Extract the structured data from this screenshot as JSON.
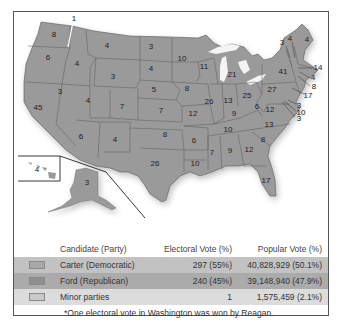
{
  "map": {
    "title": "1976 Presidential Election Electoral Map",
    "fill_color": "#9a9a9a",
    "state_labels": [
      {
        "state": "WA",
        "votes": "8",
        "x": 54,
        "y": 35
      },
      {
        "state": "WA-Reagan",
        "votes": "1",
        "x": 74,
        "y": 19
      },
      {
        "state": "OR",
        "votes": "6",
        "x": 48,
        "y": 58
      },
      {
        "state": "ID",
        "votes": "4",
        "x": 77,
        "y": 64
      },
      {
        "state": "MT",
        "votes": "4",
        "x": 107,
        "y": 46
      },
      {
        "state": "ND",
        "votes": "3",
        "x": 151,
        "y": 47
      },
      {
        "state": "SD",
        "votes": "4",
        "x": 151,
        "y": 69
      },
      {
        "state": "WY",
        "votes": "3",
        "x": 113,
        "y": 77
      },
      {
        "state": "CA",
        "votes": "45",
        "x": 38,
        "y": 108
      },
      {
        "state": "NV",
        "votes": "3",
        "x": 60,
        "y": 92
      },
      {
        "state": "UT",
        "votes": "4",
        "x": 88,
        "y": 101
      },
      {
        "state": "CO",
        "votes": "7",
        "x": 122,
        "y": 107
      },
      {
        "state": "NE",
        "votes": "5",
        "x": 154,
        "y": 90
      },
      {
        "state": "KS",
        "votes": "7",
        "x": 161,
        "y": 111
      },
      {
        "state": "AZ",
        "votes": "6",
        "x": 81,
        "y": 137
      },
      {
        "state": "NM",
        "votes": "4",
        "x": 115,
        "y": 140
      },
      {
        "state": "OK",
        "votes": "8",
        "x": 165,
        "y": 135
      },
      {
        "state": "TX",
        "votes": "26",
        "x": 155,
        "y": 164
      },
      {
        "state": "MN",
        "votes": "10",
        "x": 182,
        "y": 59
      },
      {
        "state": "IA",
        "votes": "8",
        "x": 187,
        "y": 89
      },
      {
        "state": "MO",
        "votes": "12",
        "x": 193,
        "y": 114
      },
      {
        "state": "AR",
        "votes": "6",
        "x": 194,
        "y": 141
      },
      {
        "state": "LA",
        "votes": "10",
        "x": 195,
        "y": 164
      },
      {
        "state": "WI",
        "votes": "11",
        "x": 204,
        "y": 67
      },
      {
        "state": "IL",
        "votes": "26",
        "x": 209,
        "y": 102
      },
      {
        "state": "MI",
        "votes": "21",
        "x": 232,
        "y": 75
      },
      {
        "state": "IN",
        "votes": "13",
        "x": 228,
        "y": 101
      },
      {
        "state": "OH",
        "votes": "25",
        "x": 247,
        "y": 96
      },
      {
        "state": "KY",
        "votes": "9",
        "x": 234,
        "y": 114
      },
      {
        "state": "TN",
        "votes": "10",
        "x": 228,
        "y": 130
      },
      {
        "state": "MS",
        "votes": "7",
        "x": 212,
        "y": 153
      },
      {
        "state": "AL",
        "votes": "9",
        "x": 230,
        "y": 151
      },
      {
        "state": "GA",
        "votes": "12",
        "x": 249,
        "y": 150
      },
      {
        "state": "FL",
        "votes": "17",
        "x": 266,
        "y": 181
      },
      {
        "state": "SC",
        "votes": "8",
        "x": 263,
        "y": 140
      },
      {
        "state": "NC",
        "votes": "13",
        "x": 269,
        "y": 125
      },
      {
        "state": "VA",
        "votes": "12",
        "x": 270,
        "y": 110
      },
      {
        "state": "WV",
        "votes": "6",
        "x": 257,
        "y": 107
      },
      {
        "state": "PA",
        "votes": "27",
        "x": 272,
        "y": 90
      },
      {
        "state": "NY",
        "votes": "41",
        "x": 283,
        "y": 72
      },
      {
        "state": "ME",
        "votes": "4",
        "x": 307,
        "y": 40
      },
      {
        "state": "VT",
        "votes": "3",
        "x": 282,
        "y": 43
      },
      {
        "state": "NH",
        "votes": "4",
        "x": 290,
        "y": 39
      },
      {
        "state": "MA",
        "votes": "14",
        "x": 318,
        "y": 68
      },
      {
        "state": "RI",
        "votes": "4",
        "x": 313,
        "y": 78
      },
      {
        "state": "CT",
        "votes": "8",
        "x": 314,
        "y": 87
      },
      {
        "state": "NJ",
        "votes": "17",
        "x": 308,
        "y": 96
      },
      {
        "state": "DE",
        "votes": "3",
        "x": 299,
        "y": 106
      },
      {
        "state": "MD",
        "votes": "10",
        "x": 301,
        "y": 113
      },
      {
        "state": "DC",
        "votes": "3",
        "x": 299,
        "y": 119
      },
      {
        "state": "HI",
        "votes": "4",
        "x": 37,
        "y": 170
      },
      {
        "state": "AK",
        "votes": "3",
        "x": 87,
        "y": 183
      }
    ]
  },
  "legend": {
    "headers": {
      "candidate": "Candidate (Party)",
      "electoral": "Electoral Vote (%)",
      "popular": "Popular Vote (%)"
    },
    "rows": [
      {
        "candidate": "Carter (Democratic)",
        "electoral": "297 (55%)",
        "popular": "40,828,929 (50.1%)",
        "color": "#a8a8a8"
      },
      {
        "candidate": "Ford (Republican)",
        "electoral": "240 (45%)",
        "popular": "39,148,940 (47.9%)",
        "color": "#8f8f8f"
      },
      {
        "candidate": "Minor parties",
        "electoral": "1",
        "popular": "1,575,459 (2.1%)",
        "color": "#c9c9c9"
      }
    ],
    "footnote": "*One electoral vote in Washington was won by Reagan."
  }
}
